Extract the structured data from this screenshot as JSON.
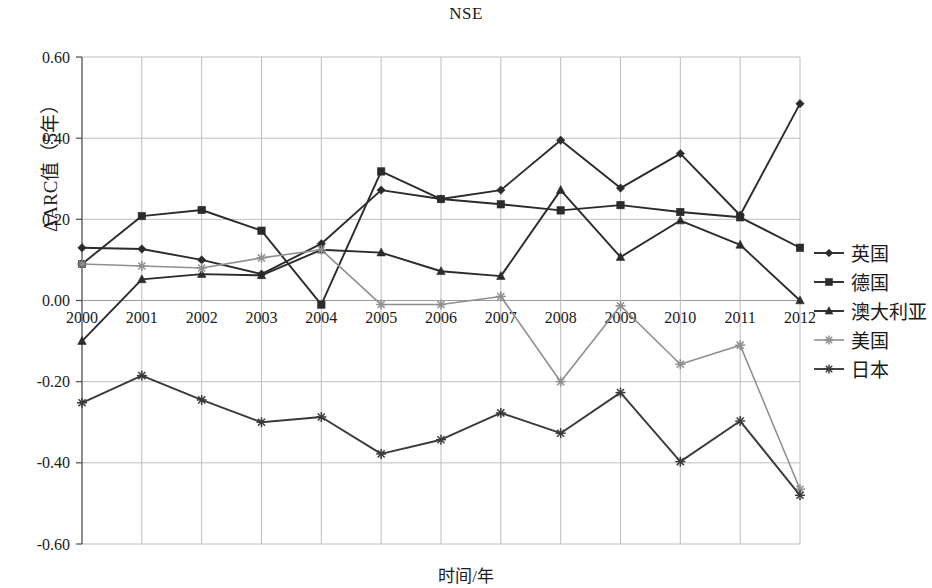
{
  "chart_data": {
    "type": "line",
    "title": "NSE",
    "xlabel": "时间/年",
    "ylabel": "ΔARC值（5年）",
    "x": [
      2000,
      2001,
      2002,
      2003,
      2004,
      2005,
      2006,
      2007,
      2008,
      2009,
      2010,
      2011,
      2012
    ],
    "categories": [
      "2000",
      "2001",
      "2002",
      "2003",
      "2004",
      "2005",
      "2006",
      "2007",
      "2008",
      "2009",
      "2010",
      "2011",
      "2012"
    ],
    "ylim": [
      -0.6,
      0.6
    ],
    "yticks": [
      0.6,
      0.4,
      0.2,
      0.0,
      -0.2,
      -0.4,
      -0.6
    ],
    "ytick_labels": [
      "0.60",
      "0.40",
      "0.20",
      "0.00",
      "-0.20",
      "-0.40",
      "-0.60"
    ],
    "grid": true,
    "legend_position": "right",
    "series": [
      {
        "name": "英国",
        "marker": "diamond",
        "color": "#2b2b2b",
        "values": [
          0.13,
          0.127,
          0.1,
          0.065,
          0.14,
          0.272,
          0.25,
          0.272,
          0.395,
          0.277,
          0.362,
          0.21,
          0.485
        ]
      },
      {
        "name": "德国",
        "marker": "square",
        "color": "#2b2b2b",
        "values": [
          0.09,
          0.208,
          0.223,
          0.172,
          -0.01,
          0.318,
          0.25,
          0.237,
          0.222,
          0.235,
          0.218,
          0.205,
          0.13
        ]
      },
      {
        "name": "澳大利亚",
        "marker": "triangle",
        "color": "#2b2b2b",
        "values": [
          -0.1,
          0.052,
          0.065,
          0.062,
          0.125,
          0.118,
          0.072,
          0.06,
          0.272,
          0.107,
          0.197,
          0.137,
          0.0
        ]
      },
      {
        "name": "美国",
        "marker": "star4",
        "color": "#8f8f8f",
        "values": [
          0.09,
          0.085,
          0.08,
          0.105,
          0.125,
          -0.01,
          -0.01,
          0.01,
          -0.2,
          -0.013,
          -0.157,
          -0.11,
          -0.465
        ]
      },
      {
        "name": "日本",
        "marker": "asterisk",
        "color": "#3a3a3a",
        "values": [
          -0.252,
          -0.185,
          -0.245,
          -0.3,
          -0.287,
          -0.378,
          -0.343,
          -0.277,
          -0.327,
          -0.227,
          -0.397,
          -0.297,
          -0.48
        ]
      }
    ]
  },
  "axes": {
    "plot_left": 82,
    "plot_right": 800,
    "plot_top": 57,
    "plot_bottom": 544
  }
}
